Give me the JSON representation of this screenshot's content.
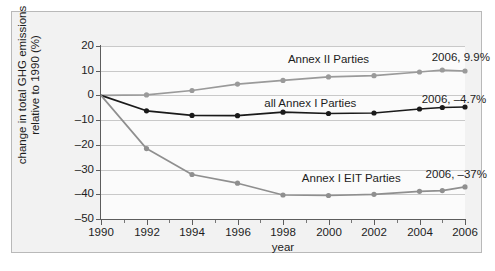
{
  "chart_data": {
    "type": "line",
    "title": "",
    "xlabel": "year",
    "ylabel": "change in total GHG emissions relative to 1990 (%)",
    "x": [
      1990,
      1992,
      1994,
      1996,
      1998,
      2000,
      2002,
      2004,
      2005,
      2006
    ],
    "xlim": [
      1990,
      2006
    ],
    "ylim": [
      -50,
      20
    ],
    "xticks": [
      1990,
      1992,
      1994,
      1996,
      1998,
      2000,
      2002,
      2004,
      2006
    ],
    "yticks": [
      20,
      10,
      0,
      -10,
      -20,
      -30,
      -40,
      -50
    ],
    "xtick_labels": [
      "1990",
      "1992",
      "1994",
      "1996",
      "1998",
      "2000",
      "2002",
      "2004",
      "2006"
    ],
    "ytick_labels": [
      "20",
      "10",
      "0",
      "–10",
      "–20",
      "–30",
      "–40",
      "–50"
    ],
    "grid": true,
    "legend_position": "inline-annotations",
    "series": [
      {
        "name": "Annex II Parties",
        "color": "#9a9a9a",
        "label_text": "Annex II Parties",
        "endpoint_annotation": "2006, 9.9%",
        "values": [
          0.0,
          0.2,
          2.0,
          4.6,
          6.1,
          7.5,
          8.0,
          9.5,
          10.3,
          9.9
        ]
      },
      {
        "name": "all Annex I Parties",
        "color": "#1a1a1a",
        "label_text": "all Annex I Parties",
        "endpoint_annotation": "2006, –4.7%",
        "values": [
          0.0,
          -6.2,
          -8.1,
          -8.2,
          -6.8,
          -7.3,
          -7.1,
          -5.5,
          -4.9,
          -4.7
        ]
      },
      {
        "name": "Annex I EIT Parties",
        "color": "#8f8f8f",
        "label_text": "Annex I EIT Parties",
        "endpoint_annotation": "2006, –37%",
        "values": [
          0.0,
          -21.5,
          -32.0,
          -35.5,
          -40.3,
          -40.5,
          -40.0,
          -38.8,
          -38.5,
          -37.0
        ]
      }
    ],
    "annotations": [
      {
        "name": "annex-ii-series-label",
        "text": "Annex II Parties",
        "x": 2000.0,
        "y": 14.5
      },
      {
        "name": "all-annex-i-series-label",
        "text": "all Annex I Parties",
        "x": 1999.2,
        "y": -3.5
      },
      {
        "name": "annex-i-eit-series-label",
        "text": "Annex I EIT Parties",
        "x": 2001.0,
        "y": -33.8
      },
      {
        "name": "annex-ii-endpoint-label",
        "text": "2006, 9.9%",
        "x": 2005.2,
        "y": 15.0
      },
      {
        "name": "all-annex-i-endpoint-label",
        "text": "2006, –4.7%",
        "x": 2004.9,
        "y": -2.0
      },
      {
        "name": "annex-i-eit-endpoint-label",
        "text": "2006, –37%",
        "x": 2005.0,
        "y": -32.0
      }
    ]
  },
  "colors": {
    "figure_background": "#f2f2f2",
    "plot_background": "#fbfbfb",
    "frame_border": "#b9b9b9",
    "axis": "#5d5d5d",
    "gridline": "#c9c9c9",
    "text": "#1d1d1d",
    "series_annex_ii": "#9a9a9a",
    "series_all_annex_i": "#1a1a1a",
    "series_annex_i_eit": "#8f8f8f"
  }
}
